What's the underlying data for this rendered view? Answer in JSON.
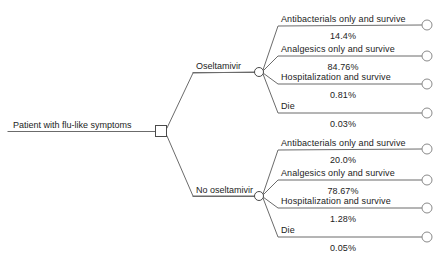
{
  "diagram": {
    "type": "decision-tree",
    "root": {
      "label": "Patient with flu-like symptoms",
      "node_shape": "square"
    },
    "branches": [
      {
        "label": "Oseltamivir",
        "node_shape": "circle",
        "outcomes": [
          {
            "label": "Antibacterials only and survive",
            "probability": "14.4%"
          },
          {
            "label": "Analgesics only and survive",
            "probability": "84.76%"
          },
          {
            "label": "Hospitalization and survive",
            "probability": "0.81%"
          },
          {
            "label": "Die",
            "probability": "0.03%"
          }
        ]
      },
      {
        "label": "No oseltamivir",
        "node_shape": "circle",
        "outcomes": [
          {
            "label": "Antibacterials only and survive",
            "probability": "20.0%"
          },
          {
            "label": "Analgesics only and survive",
            "probability": "78.67%"
          },
          {
            "label": "Hospitalization and survive",
            "probability": "1.28%"
          },
          {
            "label": "Die",
            "probability": "0.05%"
          }
        ]
      }
    ],
    "colors": {
      "line": "#6b6b6b",
      "node_stroke": "#4a4a4a",
      "node_fill": "#ffffff",
      "text": "#1c1c1c",
      "background": "#ffffff"
    }
  }
}
